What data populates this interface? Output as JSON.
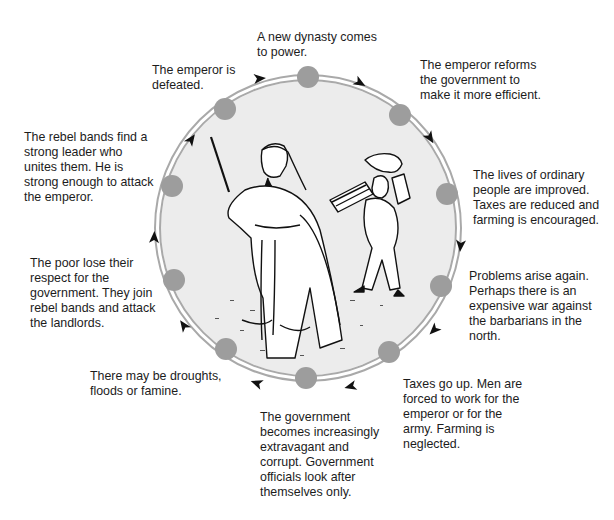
{
  "diagram": {
    "type": "dynastic-cycle",
    "direction": "clockwise",
    "colors": {
      "ring": "#a9a9a9",
      "node": "#9d9d9d",
      "disc_fill": "#ececec",
      "arrow": "#111111",
      "text": "#1c1c1c"
    },
    "illustration": "Ink drawing of a bearded official in robes holding a staff, followed by a servant carrying bundles on his back",
    "stages": [
      {
        "id": 1,
        "text": "A new dynasty comes\nto power."
      },
      {
        "id": 2,
        "text": "The emperor reforms\nthe government to\nmake it more efficient."
      },
      {
        "id": 3,
        "text": "The lives of ordinary\npeople are improved.\nTaxes are reduced and\nfarming is encouraged."
      },
      {
        "id": 4,
        "text": "Problems arise again.\nPerhaps there is an\nexpensive war against\nthe barbarians in the\nnorth."
      },
      {
        "id": 5,
        "text": "Taxes go up. Men are\nforced to work for the\nemperor or for the\narmy. Farming is\nneglected."
      },
      {
        "id": 6,
        "text": "The government\nbecomes increasingly\nextravagant and\ncorrupt. Government\nofficials look after\nthemselves only."
      },
      {
        "id": 7,
        "text": "There may be droughts,\nfloods or famine."
      },
      {
        "id": 8,
        "text": "The poor lose their\nrespect for the\ngovernment. They join\nrebel bands and attack\nthe landlords."
      },
      {
        "id": 9,
        "text": "The rebel bands find a\nstrong leader who\nunites them. He is\nstrong enough to attack\nthe emperor."
      },
      {
        "id": 10,
        "text": "The emperor is\ndefeated."
      }
    ]
  }
}
